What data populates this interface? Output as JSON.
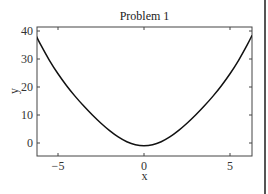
{
  "chart_data": {
    "type": "line",
    "title": "Problem 1",
    "xlabel": "x",
    "ylabel": "y",
    "xlim": [
      -6.2832,
      6.2832
    ],
    "ylim": [
      -5,
      41.5
    ],
    "xticks": [
      -5,
      0,
      5
    ],
    "xtick_labels": [
      "−5",
      "0",
      "5"
    ],
    "yticks": [
      0,
      10,
      20,
      30,
      40
    ],
    "ytick_labels": [
      "0",
      "10",
      "20",
      "30",
      "40"
    ],
    "grid": false,
    "legend": null,
    "series": [
      {
        "name": "y = x^2 - cos(x)",
        "color": "#111111",
        "x": [
          -6.2832,
          -6.0,
          -5.5,
          -5.0,
          -4.5,
          -4.0,
          -3.5,
          -3.0,
          -2.5,
          -2.0,
          -1.5,
          -1.0,
          -0.5,
          0.0,
          0.5,
          1.0,
          1.5,
          2.0,
          2.5,
          3.0,
          3.5,
          4.0,
          4.5,
          5.0,
          5.5,
          6.0,
          6.2832
        ],
        "y": [
          38.48,
          35.04,
          29.54,
          24.72,
          20.46,
          16.65,
          13.19,
          9.99,
          7.05,
          4.42,
          2.18,
          0.46,
          -0.63,
          -1.0,
          -0.63,
          0.46,
          2.18,
          4.42,
          7.05,
          9.99,
          13.19,
          16.65,
          20.46,
          24.72,
          29.54,
          35.04,
          38.48
        ]
      }
    ]
  },
  "layout": {
    "plot_left": 37,
    "plot_right": 252,
    "plot_top": 27,
    "plot_bottom": 156,
    "x_origin_px": 144,
    "x_px_per_unit": 17.2,
    "y_origin_px": 143,
    "y_px_per_unit": 2.8
  }
}
